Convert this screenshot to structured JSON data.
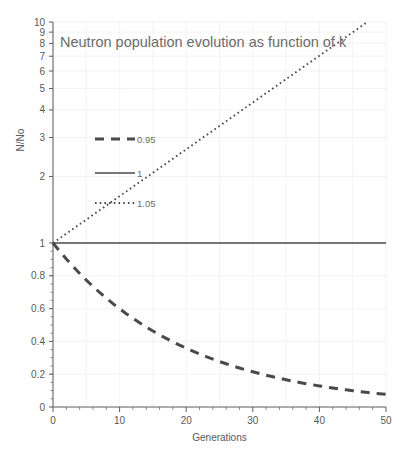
{
  "chart_data": {
    "type": "line",
    "title": "Neutron population evolution as function of k",
    "xlabel": "Generations",
    "ylabel": "N/No",
    "yscale": "log",
    "ylim": [
      0.07,
      10
    ],
    "xlim": [
      0,
      50
    ],
    "grid": true,
    "legend_position": "inside-left",
    "y_tick_labels": [
      "10",
      "9",
      "8",
      "7",
      "6",
      "5",
      "4",
      "3",
      "2",
      "1",
      "0.8",
      "0.6",
      "0.4",
      "0.2",
      "0"
    ],
    "y_tick_values": [
      10,
      9,
      8,
      7,
      6,
      5,
      4,
      3,
      2,
      1,
      0.8,
      0.6,
      0.4,
      0.2,
      0
    ],
    "x_tick_labels": [
      "0",
      "10",
      "20",
      "30",
      "40",
      "50"
    ],
    "x_tick_values": [
      0,
      10,
      20,
      30,
      40,
      50
    ],
    "x": [
      0,
      1,
      2,
      3,
      4,
      5,
      6,
      7,
      8,
      9,
      10,
      11,
      12,
      13,
      14,
      15,
      16,
      17,
      18,
      19,
      20,
      21,
      22,
      23,
      24,
      25,
      26,
      27,
      28,
      29,
      30,
      31,
      32,
      33,
      34,
      35,
      36,
      37,
      38,
      39,
      40,
      41,
      42,
      43,
      44,
      45,
      46,
      47,
      48,
      49,
      50
    ],
    "series": [
      {
        "name": "0.95",
        "k": 0.95,
        "style": "dashed",
        "color": "#4a4a4a",
        "values": [
          1,
          0.95,
          0.9025,
          0.857375,
          0.814506,
          0.773781,
          0.735092,
          0.698337,
          0.66342,
          0.630249,
          0.598737,
          0.5688,
          0.54036,
          0.513342,
          0.487675,
          0.463291,
          0.440127,
          0.41812,
          0.397214,
          0.377354,
          0.358486,
          0.340562,
          0.323534,
          0.307357,
          0.291989,
          0.27739,
          0.26352,
          0.250344,
          0.237827,
          0.225936,
          0.214639,
          0.203907,
          0.193711,
          0.184026,
          0.174825,
          0.166083,
          0.157779,
          0.14989,
          0.142396,
          0.135276,
          0.128512,
          0.122086,
          0.115982,
          0.110183,
          0.104674,
          0.09944,
          0.094468,
          0.089745,
          0.085258,
          0.080995,
          0.076945
        ]
      },
      {
        "name": "1",
        "k": 1,
        "style": "solid",
        "color": "#4a4a4a",
        "values": [
          1,
          1,
          1,
          1,
          1,
          1,
          1,
          1,
          1,
          1,
          1,
          1,
          1,
          1,
          1,
          1,
          1,
          1,
          1,
          1,
          1,
          1,
          1,
          1,
          1,
          1,
          1,
          1,
          1,
          1,
          1,
          1,
          1,
          1,
          1,
          1,
          1,
          1,
          1,
          1,
          1,
          1,
          1,
          1,
          1,
          1,
          1,
          1,
          1,
          1,
          1
        ]
      },
      {
        "name": "1.05",
        "k": 1.05,
        "style": "dotted",
        "color": "#4a4a4a",
        "values": [
          1,
          1.05,
          1.1025,
          1.157625,
          1.215506,
          1.276282,
          1.340096,
          1.4071,
          1.477455,
          1.551328,
          1.628895,
          1.710339,
          1.795856,
          1.885649,
          1.979932,
          2.078928,
          2.182875,
          2.292018,
          2.406619,
          2.52695,
          2.653298,
          2.785963,
          2.925261,
          3.071524,
          3.2251,
          3.386355,
          3.555673,
          3.733456,
          3.920129,
          4.116136,
          4.321942,
          4.53804,
          4.764941,
          5.003189,
          5.253348,
          5.516015,
          5.791816,
          6.081407,
          6.385477,
          6.704751,
          7.039989,
          7.391988,
          7.761588,
          8.149667,
          8.55715,
          8.985008,
          9.434258,
          9.905971,
          10.401269,
          10.921333,
          11.4674
        ]
      }
    ]
  },
  "legend": {
    "items": [
      {
        "label": "0.95",
        "style": "dashed"
      },
      {
        "label": "1",
        "style": "solid"
      },
      {
        "label": "1.05",
        "style": "dotted"
      }
    ]
  }
}
